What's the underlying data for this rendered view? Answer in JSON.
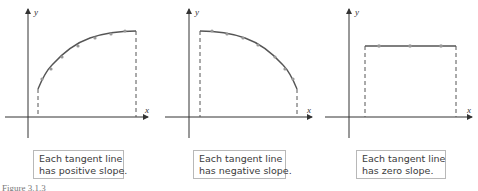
{
  "panels": [
    {
      "id": "positive",
      "axes": {
        "x_label": "x",
        "y_label": "y"
      },
      "caption": {
        "line1": "Each tangent line",
        "line2": "has positive slope."
      }
    },
    {
      "id": "negative",
      "axes": {
        "x_label": "x",
        "y_label": "y"
      },
      "caption": {
        "line1": "Each tangent line",
        "line2": "has negative slope."
      }
    },
    {
      "id": "zero",
      "axes": {
        "x_label": "x",
        "y_label": "y"
      },
      "caption": {
        "line1": "Each tangent line",
        "line2": "has zero slope."
      }
    }
  ],
  "figure_label": "Figure 3.1.3",
  "colors": {
    "axis": "#333333",
    "curve": "#555555",
    "dot": "#999999",
    "box_border": "#b8b8b8"
  }
}
